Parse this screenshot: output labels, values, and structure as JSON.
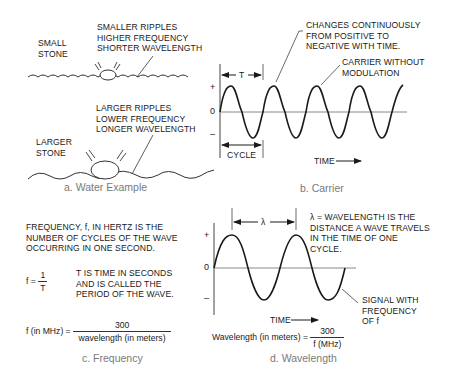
{
  "panels": {
    "water": {
      "caption": "a. Water Example",
      "small_stone": [
        "SMALL",
        "STONE"
      ],
      "small_ripples": [
        "SMALLER RIPPLES",
        "HIGHER FREQUENCY",
        "SHORTER WAVELENGTH"
      ],
      "large_stone": [
        "LARGER",
        "STONE"
      ],
      "large_ripples": [
        "LARGER RIPPLES",
        "LOWER FREQUENCY",
        "LONGER WAVELENGTH"
      ]
    },
    "carrier": {
      "caption": "b. Carrier",
      "annotation_changes": [
        "CHANGES CONTINUOUSLY",
        "FROM POSITIVE TO",
        "NEGATIVE WITH TIME."
      ],
      "annotation_carrier": [
        "CARRIER WITHOUT",
        "MODULATION"
      ],
      "period_label": "T",
      "cycle_label": "CYCLE",
      "time_label": "TIME",
      "axis": {
        "plus": "+",
        "zero": "0",
        "minus": "–"
      }
    },
    "frequency": {
      "caption": "c. Frequency",
      "definition": [
        "FREQUENCY, f, IN HERTZ IS THE",
        "NUMBER OF CYCLES OF THE WAVE",
        "OCCURRING IN ONE SECOND."
      ],
      "formula1": {
        "lhs": "f =",
        "num": "1",
        "den": "T"
      },
      "t_note": [
        "T IS TIME IN SECONDS",
        "AND IS CALLED THE",
        "PERIOD OF THE WAVE."
      ],
      "formula2": {
        "lhs": "f (in MHz) =",
        "num": "300",
        "den": "wavelength (in meters)"
      }
    },
    "wavelength": {
      "caption": "d. Wavelength",
      "lambda_label": "λ",
      "definition": [
        "λ = WAVELENGTH IS THE",
        "DISTANCE A WAVE TRAVELS",
        "IN THE TIME OF ONE",
        "CYCLE."
      ],
      "signal_note": [
        "SIGNAL WITH",
        "FREQUENCY",
        "OF f"
      ],
      "time_label": "TIME",
      "axis": {
        "plus": "+",
        "zero": "0",
        "minus": "–"
      },
      "formula": {
        "lhs": "Wavelength (in meters) =",
        "num": "300",
        "den": "f (MHz)"
      }
    }
  }
}
